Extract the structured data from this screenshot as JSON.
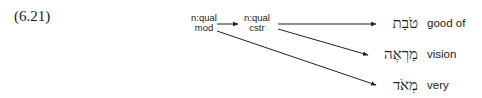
{
  "example": {
    "number": "(6.21)"
  },
  "nodes": [
    {
      "id": "mod",
      "line1": "n:qual",
      "line2": "mod"
    },
    {
      "id": "cstr",
      "line1": "n:qual",
      "line2": "cstr"
    }
  ],
  "leaves": [
    {
      "hebrew": "טֹבַת",
      "gloss": "good of"
    },
    {
      "hebrew": "מַרְאֶה",
      "gloss": "vision"
    },
    {
      "hebrew": "מְאֹד",
      "gloss": "very"
    }
  ],
  "edges": [
    {
      "from": "mod",
      "to": "cstr"
    },
    {
      "from": "cstr",
      "to": "leaf-0"
    },
    {
      "from": "cstr",
      "to": "leaf-1"
    },
    {
      "from": "mod",
      "to": "leaf-2"
    }
  ],
  "colors": {
    "ink": "#222222",
    "background": "#ffffff"
  }
}
